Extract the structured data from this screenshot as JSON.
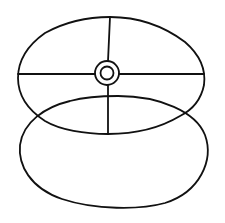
{
  "diagram": {
    "type": "line-drawing",
    "stroke_color": "#111111",
    "background": "#ffffff",
    "shapes": {
      "upper_ellipse": {
        "cx": 111,
        "cy": 75,
        "rx": 93,
        "ry": 59
      },
      "lower_ellipse": {
        "cx": 115,
        "cy": 152,
        "rx": 95,
        "ry": 56
      },
      "hub_outer": {
        "cx": 107,
        "cy": 73,
        "r": 12
      },
      "hub_inner": {
        "cx": 107,
        "cy": 73,
        "r": 6.5
      },
      "horizontal_spoke": {
        "y": 74
      },
      "vertical_spoke": {
        "x": 108
      }
    }
  }
}
